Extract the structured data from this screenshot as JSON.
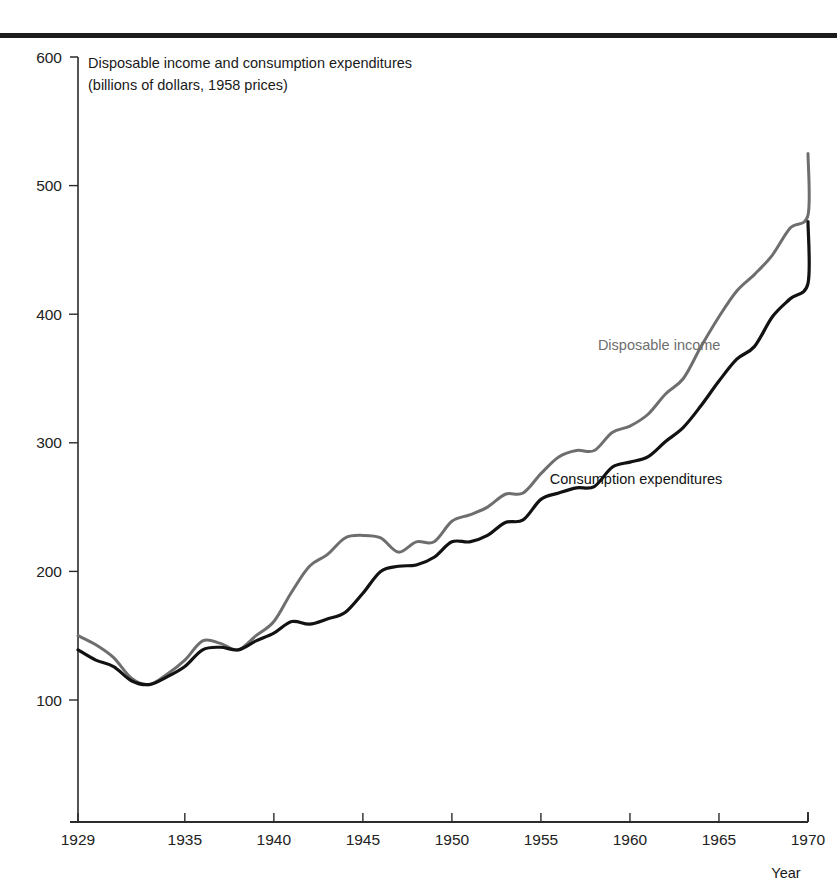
{
  "figure": {
    "top_rule_color": "#1c1c1c",
    "background_color": "#ffffff"
  },
  "chart_data": {
    "type": "line",
    "title": "Disposable income and consumption expenditures",
    "subtitle": "(billions of dollars, 1958 prices)",
    "xlabel": "Year",
    "ylabel": "",
    "grid": false,
    "legend_position": "inline-annotation",
    "xlim": [
      1929,
      1970
    ],
    "ylim": [
      0,
      600
    ],
    "y_ticks": [
      100,
      200,
      300,
      400,
      500,
      600
    ],
    "y_tick_labels": [
      "100",
      "200",
      "300",
      "400",
      "500",
      "600"
    ],
    "x_ticks": [
      1929,
      1935,
      1940,
      1945,
      1950,
      1955,
      1960,
      1965,
      1970
    ],
    "x_tick_labels": [
      "1929",
      "1935",
      "1940",
      "1945",
      "1950",
      "1955",
      "1960",
      "1965",
      "1970"
    ],
    "x": [
      1929,
      1930,
      1931,
      1932,
      1933,
      1934,
      1935,
      1936,
      1937,
      1938,
      1939,
      1940,
      1941,
      1942,
      1943,
      1944,
      1945,
      1946,
      1947,
      1948,
      1949,
      1950,
      1951,
      1952,
      1953,
      1954,
      1955,
      1956,
      1957,
      1958,
      1959,
      1960,
      1961,
      1962,
      1963,
      1964,
      1965,
      1966,
      1967,
      1968,
      1969,
      1970
    ],
    "series": [
      {
        "name": "Disposable income",
        "color": "#6e6e6e",
        "stroke_width": 3.0,
        "label_x": 1958.2,
        "label_y": 372,
        "values": [
          150,
          143,
          133,
          117,
          112,
          120,
          131,
          146,
          144,
          139,
          150,
          161,
          184,
          204,
          213,
          226,
          228,
          226,
          215,
          223,
          223,
          239,
          244,
          250,
          260,
          261,
          276,
          289,
          294,
          294,
          308,
          313,
          322,
          338,
          350,
          375,
          398,
          418,
          431,
          446,
          467,
          477
        ],
        "end_value": 525
      },
      {
        "name": "Consumption expenditures",
        "color": "#121212",
        "stroke_width": 3.2,
        "label_x": 1955.5,
        "label_y": 268,
        "values": [
          139,
          131,
          126,
          115,
          112,
          118,
          126,
          139,
          141,
          139,
          146,
          152,
          161,
          159,
          163,
          168,
          183,
          200,
          204,
          205,
          211,
          223,
          223,
          228,
          238,
          240,
          256,
          261,
          265,
          266,
          281,
          285,
          289,
          301,
          312,
          329,
          348,
          365,
          375,
          398,
          412,
          424
        ],
        "end_value": 472
      }
    ]
  }
}
